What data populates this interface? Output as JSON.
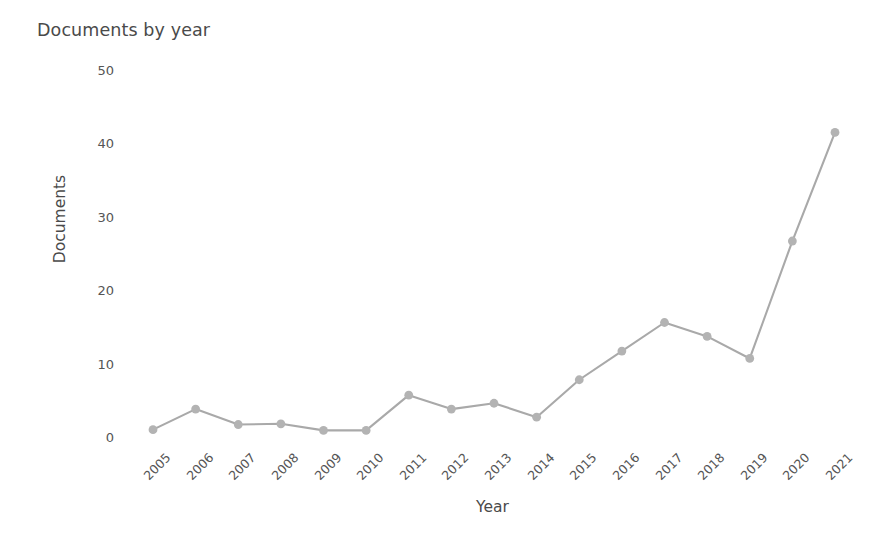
{
  "chart_data": {
    "type": "line",
    "title": "Documents by year",
    "xlabel": "Year",
    "ylabel": "Documents",
    "categories": [
      "2005",
      "2006",
      "2007",
      "2008",
      "2009",
      "2010",
      "2011",
      "2012",
      "2013",
      "2014",
      "2015",
      "2016",
      "2017",
      "2018",
      "2019",
      "2020",
      "2021"
    ],
    "values": [
      1,
      3.8,
      1.7,
      1.8,
      0.9,
      0.9,
      5.7,
      3.8,
      4.6,
      2.7,
      7.8,
      11.7,
      15.6,
      13.7,
      10.7,
      26.7,
      41.5
    ],
    "series": [
      {
        "name": "Documents",
        "values": [
          1,
          3.8,
          1.7,
          1.8,
          0.9,
          0.9,
          5.7,
          3.8,
          4.6,
          2.7,
          7.8,
          11.7,
          15.6,
          13.7,
          10.7,
          26.7,
          41.5
        ]
      }
    ],
    "x_tick_labels": [
      "2005",
      "2006",
      "2007",
      "2008",
      "2009",
      "2010",
      "2011",
      "2012",
      "2013",
      "2014",
      "2015",
      "2016",
      "2017",
      "2018",
      "2019",
      "2020",
      "2021"
    ],
    "y_tick_labels": [
      "0",
      "10",
      "20",
      "30",
      "40",
      "50"
    ],
    "y_ticks": [
      0,
      10,
      20,
      30,
      40,
      50
    ],
    "ylim": [
      0,
      50
    ],
    "grid": false,
    "legend": false,
    "legend_position": "none",
    "x_tick_rotation": -45,
    "marker": "circle",
    "colors": {
      "line": "#a9a9a9",
      "marker": "#b3b3b3",
      "title_text": "#4a4a4a",
      "tick_text": "#555555",
      "background": "#ffffff"
    }
  }
}
